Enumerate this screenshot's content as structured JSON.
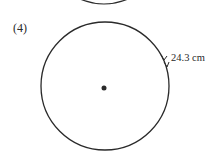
{
  "figure": {
    "number_label": "(4)",
    "shape": "circle",
    "center_marked": true,
    "arc_length_label": "24.3 cm",
    "colors": {
      "stroke": "#2a2a2a",
      "background": "#ffffff"
    }
  }
}
